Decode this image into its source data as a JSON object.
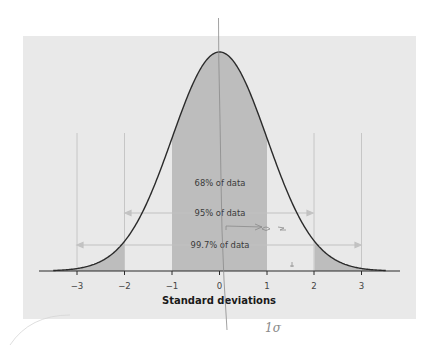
{
  "chart_data": {
    "type": "area",
    "title": "",
    "subtitle": "",
    "xlabel": "Standard deviations",
    "ylabel": "",
    "xlim": [
      -3.5,
      3.5
    ],
    "ylim": [
      0,
      0.4
    ],
    "grid": false,
    "legend": null,
    "x_ticks": [
      -3,
      -2,
      -1,
      0,
      1,
      2,
      3
    ],
    "x_tick_labels": [
      "−3",
      "−2",
      "−1",
      "0",
      "1",
      "2",
      "3"
    ],
    "curve": {
      "name": "Normal distribution (mean 0, SD 1)",
      "x": [
        -3.5,
        -3,
        -2.5,
        -2,
        -1.5,
        -1,
        -0.5,
        0,
        0.5,
        1,
        1.5,
        2,
        2.5,
        3,
        3.5
      ],
      "y": [
        0.0009,
        0.0044,
        0.0175,
        0.054,
        0.1295,
        0.242,
        0.3521,
        0.3989,
        0.3521,
        0.242,
        0.1295,
        0.054,
        0.0175,
        0.0044,
        0.0009
      ]
    },
    "shaded_regions": [
      {
        "from": -3.5,
        "to": -2,
        "label": "left tail beyond -2 SD"
      },
      {
        "from": -1,
        "to": 1,
        "label": "within 1 SD"
      },
      {
        "from": 2,
        "to": 3.5,
        "label": "right tail beyond 2 SD"
      }
    ],
    "annotations": [
      {
        "text": "68% of data",
        "range": [
          -1,
          1
        ],
        "type": "label"
      },
      {
        "text": "95% of data",
        "range": [
          -2,
          2
        ],
        "type": "double-arrow"
      },
      {
        "text": "99.7% of data",
        "range": [
          -3,
          3
        ],
        "type": "double-arrow"
      }
    ],
    "reference_lines_x": [
      -3,
      -2,
      2,
      3
    ],
    "handwritten_marks": [
      "1σ",
      "vertical pencil line through 0",
      "arrow near 0 to 1"
    ]
  },
  "labels": {
    "pct68": "68% of data",
    "pct95": "95% of data",
    "pct997": "99.7% of data",
    "xlabel": "Standard deviations",
    "handwritten": "1σ",
    "ticks": [
      "−3",
      "−2",
      "−1",
      "0",
      "1",
      "2",
      "3"
    ]
  },
  "colors": {
    "panel_bg": "#e9e9e9",
    "shade_fill": "#bdbdbd",
    "curve_stroke": "#2b2b2b",
    "guide_lines": "#c6c6c6",
    "arrow_color": "#c2c2c2",
    "pencil": "#8a8a8a"
  }
}
